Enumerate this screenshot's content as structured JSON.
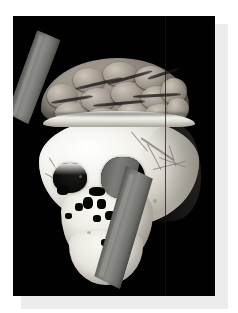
{
  "figure": {
    "kind": "3d-volume-rendering",
    "modality": "CT volume render",
    "background_color": "#010101",
    "page_background_color": "#ffffff",
    "shadow_color": "#ececec",
    "frame": {
      "x": 13,
      "y": 16,
      "width": 202,
      "height": 280
    },
    "caption": "",
    "labels": [],
    "annotations": [],
    "scale_bar": "",
    "colors": {
      "bone": "#f2f0e9",
      "brain": "#948c82",
      "rod_metal": "#7b7b78",
      "cavity": "#050505"
    },
    "structures": [
      {
        "name": "brain",
        "label": ""
      },
      {
        "name": "calvaria-rim",
        "label": ""
      },
      {
        "name": "cranial-vault",
        "label": ""
      },
      {
        "name": "orbit-left",
        "label": ""
      },
      {
        "name": "orbit-right",
        "label": ""
      },
      {
        "name": "nasal-aperture",
        "label": ""
      },
      {
        "name": "maxilla",
        "label": ""
      },
      {
        "name": "mandible",
        "label": ""
      },
      {
        "name": "tamping-iron",
        "label": ""
      }
    ]
  }
}
